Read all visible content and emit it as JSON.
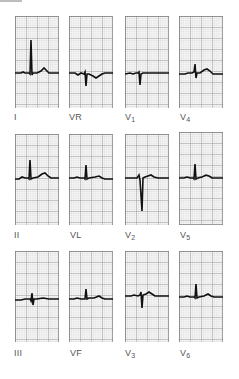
{
  "figure": {
    "title": "",
    "grid": {
      "major_color": "#7a7a7a",
      "minor_color": "#c4c4c4",
      "trace_color": "#111111"
    },
    "leads": [
      {
        "id": "I",
        "label": "I",
        "sub": "",
        "row": 0,
        "col": 0,
        "morph": "upright"
      },
      {
        "id": "VR",
        "label": "VR",
        "sub": "",
        "row": 0,
        "col": 1,
        "morph": "negative"
      },
      {
        "id": "V1",
        "label": "V",
        "sub": "1",
        "row": 0,
        "col": 2,
        "morph": "rS"
      },
      {
        "id": "V4",
        "label": "V",
        "sub": "4",
        "row": 0,
        "col": 3,
        "morph": "RS"
      },
      {
        "id": "II",
        "label": "II",
        "sub": "",
        "row": 1,
        "col": 0,
        "morph": "upright"
      },
      {
        "id": "VL",
        "label": "VL",
        "sub": "",
        "row": 1,
        "col": 1,
        "morph": "upright"
      },
      {
        "id": "V2",
        "label": "V",
        "sub": "2",
        "row": 1,
        "col": 2,
        "morph": "deepS"
      },
      {
        "id": "V5",
        "label": "V",
        "sub": "5",
        "row": 1,
        "col": 3,
        "morph": "upright"
      },
      {
        "id": "III",
        "label": "III",
        "sub": "",
        "row": 2,
        "col": 0,
        "morph": "small"
      },
      {
        "id": "VF",
        "label": "VF",
        "sub": "",
        "row": 2,
        "col": 1,
        "morph": "upright"
      },
      {
        "id": "V3",
        "label": "V",
        "sub": "3",
        "row": 2,
        "col": 2,
        "morph": "RS"
      },
      {
        "id": "V6",
        "label": "V",
        "sub": "6",
        "row": 2,
        "col": 3,
        "morph": "upright"
      }
    ]
  }
}
